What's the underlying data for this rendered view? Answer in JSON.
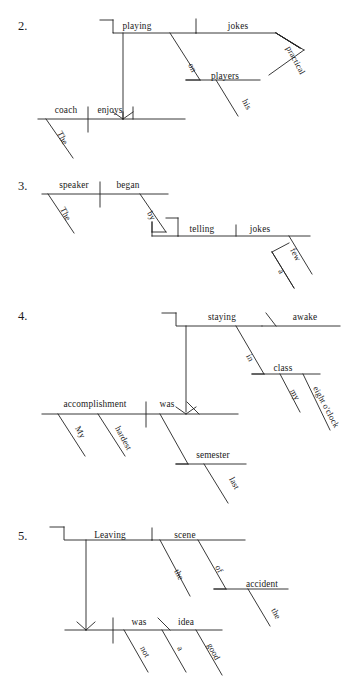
{
  "page": {
    "background_color": "#ffffff",
    "ink_color": "#232323"
  },
  "exercises": [
    {
      "id": "item-2",
      "number": "2.",
      "number_pos": [
        18,
        30
      ],
      "sentence": "The coach enjoys playing practical jokes on his players.",
      "words": [
        {
          "name": "playing",
          "text": "playing",
          "x": 137,
          "y": 29,
          "anchor": "middle",
          "slant": 0
        },
        {
          "name": "jokes",
          "text": "jokes",
          "x": 238,
          "y": 29,
          "anchor": "middle",
          "slant": 0
        },
        {
          "name": "practical",
          "text": "practical",
          "x": 286,
          "y": 48,
          "anchor": "start",
          "slant": -62,
          "size": "small"
        },
        {
          "name": "on",
          "text": "on",
          "x": 188,
          "y": 65,
          "anchor": "start",
          "slant": -62,
          "size": "small"
        },
        {
          "name": "players",
          "text": "players",
          "x": 225,
          "y": 79,
          "anchor": "middle",
          "slant": 0
        },
        {
          "name": "his",
          "text": "his",
          "x": 242,
          "y": 101,
          "anchor": "start",
          "slant": -62,
          "size": "small"
        },
        {
          "name": "coach",
          "text": "coach",
          "x": 66,
          "y": 113,
          "anchor": "middle",
          "slant": 0
        },
        {
          "name": "enjoys",
          "text": "enjoys",
          "x": 110,
          "y": 113,
          "anchor": "middle",
          "slant": 0
        },
        {
          "name": "The",
          "text": "The",
          "x": 57,
          "y": 133,
          "anchor": "start",
          "slant": -62,
          "size": "small"
        }
      ],
      "strokes": [
        "M100,20 L113,20",
        "M113,20 L113,33 L196,33",
        "M196,33 L276,33",
        "M113,33 L113,33",
        "M123,33 L123,119",
        "M196,19 L196,33",
        "M276,33 L300,48",
        "M300,48 L276,33",
        "M300,48 L276,33",
        "M276,33 L304,50",
        "M304,50 L269,75",
        "M170,33 L200,80",
        "M200,80 L186,80",
        "M186,80 L260,80",
        "M216,80 L238,116",
        "M38,119 L185,119",
        "M88,107 L88,132",
        "M133,107 L133,119",
        "M46,119 L73,158",
        "M123,119 L113,112",
        "M123,119 L133,112",
        "M123,119 L123,112"
      ]
    },
    {
      "id": "item-3",
      "number": "3.",
      "number_pos": [
        18,
        190
      ],
      "sentence": "The speaker began by telling a few jokes.",
      "words": [
        {
          "name": "speaker",
          "text": "speaker",
          "x": 74,
          "y": 188,
          "anchor": "middle",
          "slant": 0
        },
        {
          "name": "began",
          "text": "began",
          "x": 128,
          "y": 188,
          "anchor": "middle",
          "slant": 0
        },
        {
          "name": "The",
          "text": "The",
          "x": 60,
          "y": 209,
          "anchor": "start",
          "slant": -62,
          "size": "small"
        },
        {
          "name": "by",
          "text": "by",
          "x": 147,
          "y": 213,
          "anchor": "start",
          "slant": -62,
          "size": "small"
        },
        {
          "name": "telling",
          "text": "telling",
          "x": 202,
          "y": 232,
          "anchor": "middle",
          "slant": 0
        },
        {
          "name": "jokes",
          "text": "jokes",
          "x": 260,
          "y": 232,
          "anchor": "middle",
          "slant": 0
        },
        {
          "name": "few",
          "text": "few",
          "x": 290,
          "y": 250,
          "anchor": "start",
          "slant": -62,
          "size": "small"
        },
        {
          "name": "a",
          "text": "a",
          "x": 278,
          "y": 271,
          "anchor": "start",
          "slant": -62,
          "size": "small"
        }
      ],
      "strokes": [
        "M42,194 L168,194",
        "M100,182 L100,207",
        "M140,194 L166,232",
        "M166,232 L152,232",
        "M152,232 L152,222",
        "M152,222 L152,236",
        "M166,218 L178,218",
        "M152,236 L178,236",
        "M178,218 L178,236",
        "M178,236 L310,236",
        "M236,225 L236,236",
        "M48,194 L74,233",
        "M289,236 L312,274",
        "M272,252 L294,288",
        "M272,252 L289,243",
        "M294,288 L272,252"
      ]
    },
    {
      "id": "item-4",
      "number": "4.",
      "number_pos": [
        18,
        320
      ],
      "sentence": "My hardest accomplishment was staying awake in my eight o'clock class last semester.",
      "words": [
        {
          "name": "staying",
          "text": "staying",
          "x": 222,
          "y": 320,
          "anchor": "middle",
          "slant": 0
        },
        {
          "name": "awake",
          "text": "awake",
          "x": 305,
          "y": 320,
          "anchor": "middle",
          "slant": 0
        },
        {
          "name": "in",
          "text": "in",
          "x": 246,
          "y": 356,
          "anchor": "start",
          "slant": -62,
          "size": "small"
        },
        {
          "name": "class",
          "text": "class",
          "x": 283,
          "y": 371,
          "anchor": "middle",
          "slant": 0
        },
        {
          "name": "my",
          "text": "my",
          "x": 290,
          "y": 391,
          "anchor": "start",
          "slant": -62,
          "size": "small"
        },
        {
          "name": "eightoclock",
          "text": "eight o'clock",
          "x": 313,
          "y": 388,
          "anchor": "start",
          "slant": -62,
          "size": "small"
        },
        {
          "name": "accomplishment",
          "text": "accomplishment",
          "x": 95,
          "y": 407,
          "anchor": "middle",
          "slant": 0
        },
        {
          "name": "was",
          "text": "was",
          "x": 167,
          "y": 407,
          "anchor": "middle",
          "slant": 0
        },
        {
          "name": "My",
          "text": "My",
          "x": 75,
          "y": 428,
          "anchor": "start",
          "slant": -62,
          "size": "small"
        },
        {
          "name": "hardest",
          "text": "hardest",
          "x": 115,
          "y": 428,
          "anchor": "start",
          "slant": -62,
          "size": "small"
        },
        {
          "name": "semester",
          "text": "semester",
          "x": 213,
          "y": 458,
          "anchor": "middle",
          "slant": 0
        },
        {
          "name": "last",
          "text": "last",
          "x": 229,
          "y": 479,
          "anchor": "start",
          "slant": -62,
          "size": "small"
        }
      ],
      "strokes": [
        "M162,313 L176,313",
        "M176,313 L176,326 L262,326",
        "M262,326 L340,326",
        "M186,326 L186,412",
        "M266,313 L276,326",
        "M236,326 L264,374",
        "M264,374 L252,374",
        "M252,374 L320,374",
        "M280,374 L300,412",
        "M303,374 L330,430",
        "M42,414 L238,414",
        "M146,402 L146,427",
        "M186,414 L176,407",
        "M186,414 L196,407",
        "M58,414 L85,456",
        "M98,414 L125,456",
        "M160,414 L188,464",
        "M188,464 L176,464",
        "M176,464 L246,464",
        "M204,464 L228,503",
        "M187,402 L199,414"
      ]
    },
    {
      "id": "item-5",
      "number": "5.",
      "number_pos": [
        18,
        540
      ],
      "sentence": "Leaving the scene of the accident was not a good idea.",
      "words": [
        {
          "name": "Leaving",
          "text": "Leaving",
          "x": 110,
          "y": 538,
          "anchor": "middle",
          "slant": 0
        },
        {
          "name": "scene",
          "text": "scene",
          "x": 185,
          "y": 538,
          "anchor": "middle",
          "slant": 0
        },
        {
          "name": "the-scene",
          "text": "the",
          "x": 174,
          "y": 571,
          "anchor": "start",
          "slant": -62,
          "size": "small"
        },
        {
          "name": "of",
          "text": "of",
          "x": 215,
          "y": 567,
          "anchor": "start",
          "slant": -62,
          "size": "small"
        },
        {
          "name": "accident",
          "text": "accident",
          "x": 262,
          "y": 587,
          "anchor": "middle",
          "slant": 0
        },
        {
          "name": "the-accident",
          "text": "the",
          "x": 271,
          "y": 610,
          "anchor": "start",
          "slant": -62,
          "size": "small"
        },
        {
          "name": "was",
          "text": "was",
          "x": 139,
          "y": 625,
          "anchor": "middle",
          "slant": 0
        },
        {
          "name": "idea",
          "text": "idea",
          "x": 186,
          "y": 625,
          "anchor": "middle",
          "slant": 0
        },
        {
          "name": "not",
          "text": "not",
          "x": 140,
          "y": 648,
          "anchor": "start",
          "slant": -62,
          "size": "small"
        },
        {
          "name": "a",
          "text": "a",
          "x": 177,
          "y": 648,
          "anchor": "start",
          "slant": -62,
          "size": "small"
        },
        {
          "name": "good",
          "text": "good",
          "x": 207,
          "y": 645,
          "anchor": "start",
          "slant": -62,
          "size": "small"
        }
      ],
      "strokes": [
        "M50,527 L64,527",
        "M64,527 L64,540 L152,540",
        "M152,540 L245,540",
        "M86,540 L86,630",
        "M152,528 L152,540",
        "M160,540 L190,596",
        "M198,540 L226,589",
        "M226,589 L214,589",
        "M214,589 L288,589",
        "M248,589 L270,626",
        "M65,630 L222,630",
        "M113,618 L113,643",
        "M86,630 L77,622",
        "M86,630 L95,622",
        "M124,630 L148,672",
        "M158,618 L170,630",
        "M162,630 L186,672",
        "M196,630 L222,675"
      ]
    }
  ]
}
